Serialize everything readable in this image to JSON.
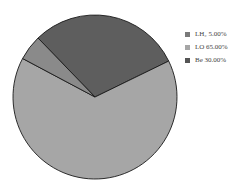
{
  "chart_data": {
    "type": "pie",
    "title": "",
    "categories": [
      "LH₂",
      "LO",
      "Be"
    ],
    "values": [
      5.0,
      65.0,
      30.0
    ],
    "labels": [
      "LH₂ 5.00%",
      "LO 65.00%",
      "Be 30.00%"
    ],
    "colors": [
      "#8a8a8a",
      "#a6a6a6",
      "#5e5e5e"
    ],
    "legend_position": "right",
    "start_angle_deg": -64,
    "direction": "counterclockwise_from_Be"
  },
  "legend": {
    "items": [
      {
        "label": "LH₂ 5.00%",
        "color": "#7a7a7a"
      },
      {
        "label": "LO 65.00%",
        "color": "#a6a6a6"
      },
      {
        "label": "Be 30.00%",
        "color": "#555555"
      }
    ]
  }
}
